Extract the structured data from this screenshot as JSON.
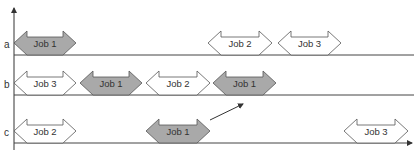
{
  "colors": {
    "axis": "#333333",
    "line": "#444444",
    "arrow_stroke": "#555555",
    "job1_fill": "#a9a9a9",
    "other_fill": "#ffffff"
  },
  "rows": [
    {
      "label": "a",
      "y": 55,
      "jobs": [
        {
          "name": "Job 1",
          "x1": 14,
          "x2": 76,
          "highlight": true
        },
        {
          "name": "Job 2",
          "x1": 208,
          "x2": 272,
          "highlight": false
        },
        {
          "name": "Job 3",
          "x1": 278,
          "x2": 341,
          "highlight": false
        }
      ]
    },
    {
      "label": "b",
      "y": 95,
      "jobs": [
        {
          "name": "Job 3",
          "x1": 14,
          "x2": 76,
          "highlight": false
        },
        {
          "name": "Job 1",
          "x1": 80,
          "x2": 142,
          "highlight": true
        },
        {
          "name": "Job 2",
          "x1": 146,
          "x2": 210,
          "highlight": false
        },
        {
          "name": "Job 1",
          "x1": 213,
          "x2": 276,
          "highlight": true
        }
      ]
    },
    {
      "label": "c",
      "y": 143,
      "jobs": [
        {
          "name": "Job 2",
          "x1": 14,
          "x2": 76,
          "highlight": false
        },
        {
          "name": "Job 1",
          "x1": 146,
          "x2": 210,
          "highlight": true
        },
        {
          "name": "Job 3",
          "x1": 344,
          "x2": 408,
          "highlight": false
        }
      ]
    }
  ],
  "move_arrow": {
    "x1": 210,
    "y1": 120,
    "x2": 243,
    "y2": 104
  }
}
